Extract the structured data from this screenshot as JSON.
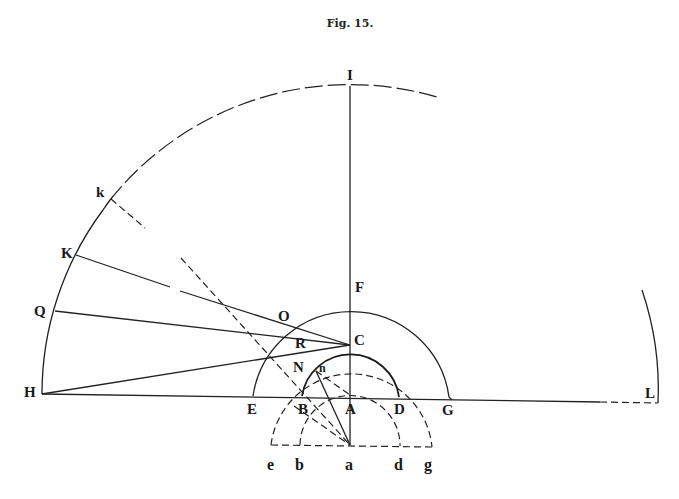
{
  "figure": {
    "caption": "Fig. 15.",
    "labels": {
      "I": "I",
      "F": "F",
      "C": "C",
      "O": "O",
      "R": "R",
      "N": "N",
      "n": "n",
      "k": "k",
      "K": "K",
      "Q": "Q",
      "H": "H",
      "E": "E",
      "B": "B",
      "A": "A",
      "D": "D",
      "G": "G",
      "L": "L",
      "e": "e",
      "b": "b",
      "a": "a",
      "d": "d",
      "g": "g"
    }
  }
}
